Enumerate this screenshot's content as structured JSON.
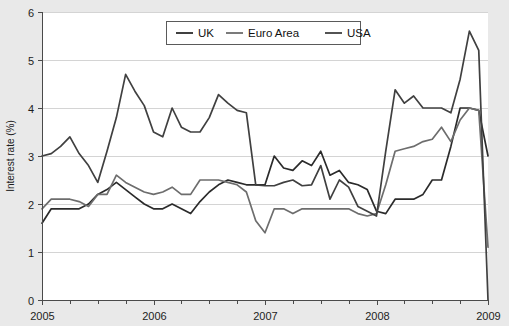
{
  "chart_data": {
    "type": "line",
    "title": "",
    "subtitle": "",
    "xlabel": "",
    "ylabel": "Interest rate (%)",
    "ylim": [
      0,
      6
    ],
    "xlim": [
      2005.0,
      2009.0
    ],
    "ytick_labels": [
      "0",
      "1",
      "2",
      "3",
      "4",
      "5",
      "6"
    ],
    "ytick_values": [
      0,
      1,
      2,
      3,
      4,
      5,
      6
    ],
    "xtick_labels": [
      "2005",
      "2006",
      "2007",
      "2008",
      "2009"
    ],
    "xtick_values": [
      2005,
      2006,
      2007,
      2008,
      2009
    ],
    "xminor_count_per_year": 4,
    "grid": "horizontal",
    "legend_position": "top-center",
    "legend_entries": [
      "UK",
      "Euro Area",
      "USA"
    ],
    "x": [
      2005.0,
      2005.083,
      2005.167,
      2005.25,
      2005.333,
      2005.417,
      2005.5,
      2005.583,
      2005.667,
      2005.75,
      2005.833,
      2005.917,
      2006.0,
      2006.083,
      2006.167,
      2006.25,
      2006.333,
      2006.417,
      2006.5,
      2006.583,
      2006.667,
      2006.75,
      2006.833,
      2006.917,
      2007.0,
      2007.083,
      2007.167,
      2007.25,
      2007.333,
      2007.417,
      2007.5,
      2007.583,
      2007.667,
      2007.75,
      2007.833,
      2007.917,
      2008.0,
      2008.083,
      2008.167,
      2008.25,
      2008.333,
      2008.417,
      2008.5,
      2008.583,
      2008.667,
      2008.75,
      2008.833,
      2008.917,
      2009.0
    ],
    "series": [
      {
        "name": "UK",
        "color": "#2b2b2b",
        "width": 1.7,
        "values": [
          1.6,
          1.9,
          1.9,
          1.9,
          1.9,
          2.0,
          2.2,
          2.3,
          2.45,
          2.3,
          2.15,
          2.0,
          1.9,
          1.9,
          2.0,
          1.9,
          1.8,
          2.05,
          2.25,
          2.4,
          2.5,
          2.45,
          2.4,
          2.4,
          2.4,
          3.0,
          2.75,
          2.7,
          2.9,
          2.8,
          3.1,
          2.6,
          2.7,
          2.45,
          2.4,
          2.3,
          1.85,
          1.8,
          2.1,
          2.1,
          2.1,
          2.2,
          2.5,
          2.5,
          3.2,
          4.0,
          4.0,
          3.95,
          3.0
        ]
      },
      {
        "name": "Euro Area",
        "color": "#6d6d6d",
        "width": 1.7,
        "values": [
          1.9,
          2.1,
          2.1,
          2.1,
          2.05,
          1.95,
          2.2,
          2.2,
          2.6,
          2.45,
          2.35,
          2.25,
          2.2,
          2.25,
          2.35,
          2.2,
          2.2,
          2.5,
          2.5,
          2.5,
          2.45,
          2.4,
          2.25,
          1.65,
          1.4,
          1.9,
          1.9,
          1.8,
          1.9,
          1.9,
          1.9,
          1.9,
          1.9,
          1.9,
          1.8,
          1.75,
          1.8,
          2.4,
          3.1,
          3.15,
          3.2,
          3.3,
          3.35,
          3.6,
          3.3,
          3.75,
          4.0,
          3.95,
          1.1
        ]
      },
      {
        "name": "USA",
        "color": "#404040",
        "width": 1.7,
        "values": [
          3.0,
          3.05,
          3.2,
          3.4,
          3.05,
          2.8,
          2.45,
          3.1,
          3.8,
          4.7,
          4.35,
          4.05,
          3.5,
          3.4,
          4.0,
          3.6,
          3.5,
          3.5,
          3.8,
          4.28,
          4.1,
          3.95,
          3.9,
          2.4,
          2.38,
          2.38,
          2.45,
          2.5,
          2.38,
          2.4,
          2.8,
          2.1,
          2.5,
          2.35,
          1.95,
          1.85,
          1.75,
          3.1,
          4.38,
          4.1,
          4.25,
          4.0,
          4.0,
          4.0,
          3.9,
          4.6,
          5.6,
          5.2,
          0.0
        ]
      }
    ]
  },
  "legend": {
    "items": [
      {
        "label": "UK",
        "color": "#2b2b2b"
      },
      {
        "label": "Euro Area",
        "color": "#6d6d6d"
      },
      {
        "label": "USA",
        "color": "#404040"
      }
    ]
  },
  "axes": {
    "y_axis_title": "Interest rate (%)",
    "y_labels": [
      "6",
      "5",
      "4",
      "3",
      "2",
      "1",
      "0"
    ],
    "x_labels": [
      "2005",
      "2006",
      "2007",
      "2008",
      "2009"
    ]
  }
}
